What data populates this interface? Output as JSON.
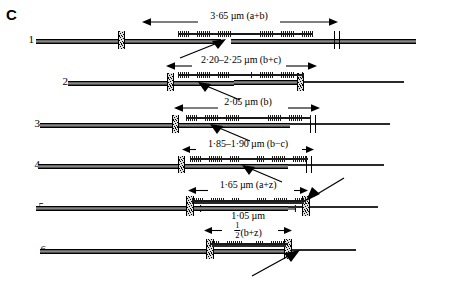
{
  "figure": {
    "panel_label": "C",
    "ink_color": "#111111"
  },
  "rows": [
    {
      "number": "1",
      "dimension": {
        "value": "3·65",
        "unit": "µm",
        "symbol": "(a+b)",
        "text": "3·65 µm (a+b)"
      },
      "has_pointer_arrow": true
    },
    {
      "number": "2",
      "dimension": {
        "value": "2·20–2·25",
        "unit": "µm",
        "symbol": "(b+c)",
        "text": "2·20–2·25 µm (b+c)"
      },
      "has_pointer_arrow": true
    },
    {
      "number": "3",
      "dimension": {
        "value": "2·05",
        "unit": "µm",
        "symbol": "(b)",
        "text": "2·05 µm (b)"
      },
      "has_pointer_arrow": true
    },
    {
      "number": "4",
      "dimension": {
        "value": "1·85–1·90",
        "unit": "µm",
        "symbol": "(b−c)",
        "text": "1·85–1·90 µm (b−c)"
      },
      "has_pointer_arrow": true
    },
    {
      "number": "5",
      "dimension": {
        "value": "1·65",
        "unit": "µm",
        "symbol": "(a+z)",
        "text": "1·65 µm (a+z)"
      },
      "secondary_dimension": {
        "value": "1·05",
        "unit": "µm",
        "text": "1·05 µm"
      },
      "has_pointer_arrow": true
    },
    {
      "number": "6",
      "dimension": {
        "fraction_numerator": "1",
        "fraction_denominator": "2",
        "symbol": "(b+z)",
        "text": "½(b+z)"
      },
      "has_pointer_arrow": true
    }
  ],
  "icons": {
    "dimension_arrow": "double-headed-arrow-icon",
    "pointer_arrow": "pointer-arrow-icon",
    "z_line": "z-line-icon",
    "actin_filament": "actin-filament-icon",
    "myosin_filament": "myosin-filament-icon"
  }
}
